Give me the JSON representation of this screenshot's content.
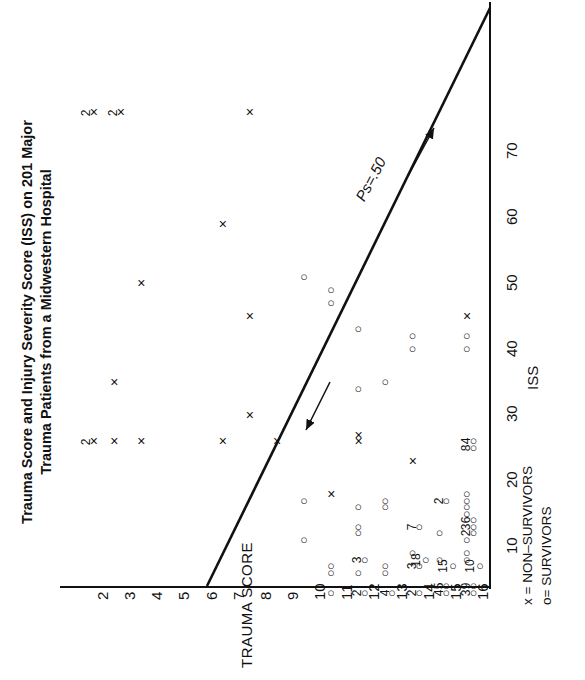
{
  "title": {
    "lines": [
      "Trauma Score and Injury Severity Score (ISS) on 201 Major",
      "Trauma Patients from a Midwestern Hospital"
    ]
  },
  "axes": {
    "x_name": "TRAUMA SCORE",
    "y_name": "ISS",
    "x_ticks": [
      "2",
      "3",
      "4",
      "5",
      "6",
      "7",
      "8",
      "9",
      "10",
      "11",
      "12",
      "13",
      "14",
      "15",
      "16"
    ],
    "y_ticks": [
      "10",
      "20",
      "30",
      "40",
      "50",
      "60",
      "70"
    ]
  },
  "legend": {
    "nonsurvivors": "x = NON–SURVIVORS",
    "survivors": "o= SURVIVORS"
  },
  "annotation": {
    "ps_line": "Ps=.50"
  },
  "glyphs": {
    "x": "×",
    "o": "○"
  },
  "chart_data": {
    "type": "scatter",
    "title": "Trauma Score and Injury Severity Score (ISS) on 201 Major Trauma Patients from a Midwestern Hospital",
    "xlabel": "TRAUMA SCORE",
    "ylabel": "ISS",
    "xlim": [
      1.5,
      16.5
    ],
    "ylim": [
      0,
      78
    ],
    "grid": false,
    "orientation": "rotated-90",
    "legend_position": "bottom-right",
    "reference_line": {
      "label": "Ps=.50",
      "description": "Diagonal survival probability line with arrowheads at both ends",
      "from": [
        6.0,
        0
      ],
      "to": [
        16.3,
        78
      ]
    },
    "series": [
      {
        "name": "NON-SURVIVORS",
        "marker": "x",
        "points": [
          {
            "x": 2,
            "y": 75,
            "count": 2
          },
          {
            "x": 3,
            "y": 75,
            "count": 2
          },
          {
            "x": 8,
            "y": 75,
            "count": 1
          },
          {
            "x": 7,
            "y": 58,
            "count": 1
          },
          {
            "x": 4,
            "y": 49,
            "count": 1
          },
          {
            "x": 8,
            "y": 44,
            "count": 1
          },
          {
            "x": 16,
            "y": 44,
            "count": 1
          },
          {
            "x": 3,
            "y": 34,
            "count": 1
          },
          {
            "x": 8,
            "y": 29,
            "count": 1
          },
          {
            "x": 2,
            "y": 25,
            "count": 2
          },
          {
            "x": 3,
            "y": 25,
            "count": 1
          },
          {
            "x": 4,
            "y": 25,
            "count": 1
          },
          {
            "x": 7,
            "y": 25,
            "count": 1
          },
          {
            "x": 9,
            "y": 25,
            "count": 1
          },
          {
            "x": 12,
            "y": 25,
            "count": 1
          },
          {
            "x": 12,
            "y": 26,
            "count": 1
          },
          {
            "x": 14,
            "y": 22,
            "count": 1
          },
          {
            "x": 11,
            "y": 17,
            "count": 1
          }
        ]
      },
      {
        "name": "SURVIVORS",
        "marker": "o",
        "points": [
          {
            "x": 10,
            "y": 50,
            "count": 1
          },
          {
            "x": 11,
            "y": 48,
            "count": 1
          },
          {
            "x": 11,
            "y": 46,
            "count": 1
          },
          {
            "x": 12,
            "y": 42,
            "count": 1
          },
          {
            "x": 14,
            "y": 41,
            "count": 1
          },
          {
            "x": 14,
            "y": 39,
            "count": 1
          },
          {
            "x": 16,
            "y": 41,
            "count": 1
          },
          {
            "x": 16,
            "y": 39,
            "count": 1
          },
          {
            "x": 12,
            "y": 33,
            "count": 1
          },
          {
            "x": 13,
            "y": 34,
            "count": 1
          },
          {
            "x": 16,
            "y": 25,
            "count": 4
          },
          {
            "x": 16,
            "y": 24,
            "count": 8
          },
          {
            "x": 10,
            "y": 16,
            "count": 1
          },
          {
            "x": 12,
            "y": 15,
            "count": 1
          },
          {
            "x": 13,
            "y": 16,
            "count": 1
          },
          {
            "x": 13,
            "y": 15,
            "count": 1
          },
          {
            "x": 15,
            "y": 16,
            "count": 2
          },
          {
            "x": 16,
            "y": 17,
            "count": 1
          },
          {
            "x": 16,
            "y": 16,
            "count": 1
          },
          {
            "x": 16,
            "y": 15,
            "count": 1
          },
          {
            "x": 16,
            "y": 14,
            "count": 1
          },
          {
            "x": 10,
            "y": 10,
            "count": 1
          },
          {
            "x": 12,
            "y": 12,
            "count": 1
          },
          {
            "x": 12,
            "y": 11,
            "count": 1
          },
          {
            "x": 14,
            "y": 12,
            "count": 7
          },
          {
            "x": 15,
            "y": 11,
            "count": 1
          },
          {
            "x": 16,
            "y": 13,
            "count": 6
          },
          {
            "x": 16,
            "y": 12,
            "count": 3
          },
          {
            "x": 16,
            "y": 11,
            "count": 2
          },
          {
            "x": 16,
            "y": 10,
            "count": 1
          },
          {
            "x": 11,
            "y": 6,
            "count": 1
          },
          {
            "x": 11,
            "y": 5,
            "count": 1
          },
          {
            "x": 12,
            "y": 7,
            "count": 3
          },
          {
            "x": 12,
            "y": 5,
            "count": 1
          },
          {
            "x": 13,
            "y": 6,
            "count": 1
          },
          {
            "x": 13,
            "y": 5,
            "count": 1
          },
          {
            "x": 14,
            "y": 8,
            "count": 1
          },
          {
            "x": 14,
            "y": 7,
            "count": 18
          },
          {
            "x": 14,
            "y": 6,
            "count": 3
          },
          {
            "x": 15,
            "y": 7,
            "count": 1
          },
          {
            "x": 15,
            "y": 6,
            "count": 15
          },
          {
            "x": 16,
            "y": 8,
            "count": 1
          },
          {
            "x": 16,
            "y": 7,
            "count": 1
          },
          {
            "x": 16,
            "y": 6,
            "count": 10
          },
          {
            "x": 11,
            "y": 2,
            "count": 1
          },
          {
            "x": 12,
            "y": 2,
            "count": 2
          },
          {
            "x": 13,
            "y": 2,
            "count": 4
          },
          {
            "x": 14,
            "y": 2,
            "count": 2
          },
          {
            "x": 15,
            "y": 3,
            "count": 5
          },
          {
            "x": 15,
            "y": 2,
            "count": 4
          },
          {
            "x": 16,
            "y": 3,
            "count": 9
          },
          {
            "x": 16,
            "y": 2,
            "count": 3
          }
        ]
      }
    ]
  }
}
